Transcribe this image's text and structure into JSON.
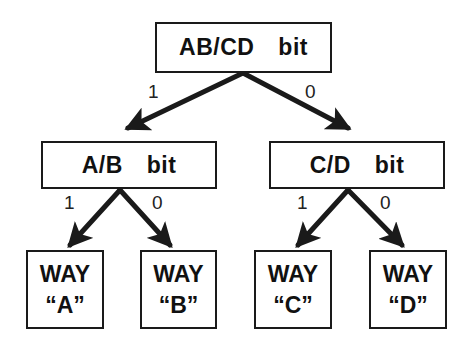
{
  "diagram": {
    "type": "binary decision tree",
    "root": {
      "label_left": "AB/CD",
      "label_right": "bit"
    },
    "level1": [
      {
        "id": "ab",
        "label_left": "A/B",
        "label_right": "bit"
      },
      {
        "id": "cd",
        "label_left": "C/D",
        "label_right": "bit"
      }
    ],
    "leaves": [
      {
        "line1": "WAY",
        "line2": "“A”"
      },
      {
        "line1": "WAY",
        "line2": "“B”"
      },
      {
        "line1": "WAY",
        "line2": "“C”"
      },
      {
        "line1": "WAY",
        "line2": "“D”"
      }
    ],
    "edge_labels": {
      "root_left": "1",
      "root_right": "0",
      "ab_left": "1",
      "ab_right": "0",
      "cd_left": "1",
      "cd_right": "0"
    },
    "colors": {
      "stroke": "#1a1a1a",
      "background": "#ffffff"
    }
  }
}
